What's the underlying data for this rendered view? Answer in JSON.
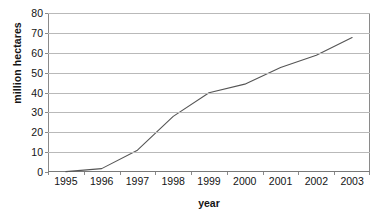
{
  "chart_data": {
    "type": "line",
    "title": "",
    "xlabel": "year",
    "ylabel": "million hectares",
    "categories": [
      "1995",
      "1996",
      "1997",
      "1998",
      "1999",
      "2000",
      "2001",
      "2002",
      "2003"
    ],
    "x": [
      1995,
      1996,
      1997,
      1998,
      1999,
      2000,
      2001,
      2002,
      2003
    ],
    "values": [
      0.2,
      1.7,
      11.0,
      28.0,
      39.9,
      44.2,
      52.6,
      58.7,
      67.7
    ],
    "series": [
      {
        "name": "million hectares",
        "values": [
          0.2,
          1.7,
          11.0,
          28.0,
          39.9,
          44.2,
          52.6,
          58.7,
          67.7
        ]
      }
    ],
    "ylim": [
      0,
      80
    ],
    "yticks": [
      0,
      10,
      20,
      30,
      40,
      50,
      60,
      70,
      80
    ],
    "ytick_labels": [
      "0",
      "10",
      "20",
      "30",
      "40",
      "50",
      "60",
      "70",
      "80"
    ],
    "xlim": [
      1994.5,
      2003.5
    ],
    "grid": "horizontal",
    "legend": "none",
    "line_color": "#555555",
    "grid_color": "#b9b9b9",
    "axis_color": "#8a8a8a",
    "background_color": "#ffffff"
  }
}
